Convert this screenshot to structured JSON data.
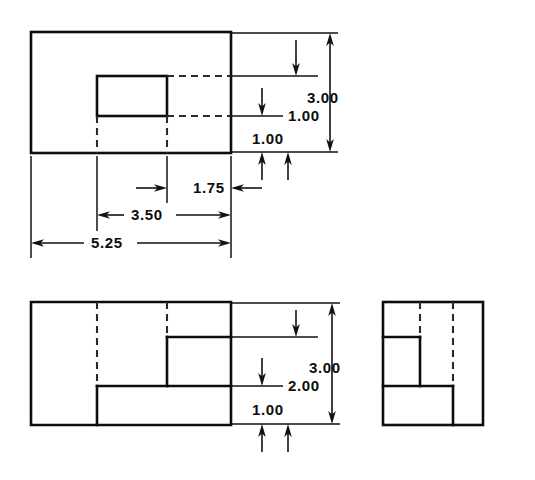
{
  "drawing": {
    "title": "Three-view orthographic engineering drawing of a stepped block with rectangular recess",
    "units": "inches",
    "line_color": "#0d0d0d",
    "background_color": "#ffffff",
    "views": [
      {
        "name": "top-view",
        "label": "Top View",
        "outline": {
          "x": 31,
          "y": 32,
          "width": 200,
          "height": 121
        },
        "features": [
          {
            "name": "recess-rectangle",
            "x": 97,
            "y": 76,
            "width": 70,
            "height": 40
          },
          {
            "name": "hidden-edge-horizontal-upper",
            "x1": 167,
            "y1": 76,
            "x2": 231,
            "y2": 76
          },
          {
            "name": "hidden-edge-horizontal-lower",
            "x1": 167,
            "y1": 116,
            "x2": 231,
            "y2": 116
          },
          {
            "name": "hidden-edge-vertical-left",
            "x1": 97,
            "y1": 116,
            "x2": 97,
            "y2": 153
          },
          {
            "name": "hidden-edge-vertical-right",
            "x1": 167,
            "y1": 116,
            "x2": 167,
            "y2": 153
          }
        ]
      },
      {
        "name": "front-view",
        "label": "Front View",
        "outline": {
          "x": 31,
          "y": 302,
          "width": 200,
          "height": 123
        },
        "features": [
          {
            "name": "step-edge-upper",
            "x1": 167,
            "y1": 337,
            "x2": 231,
            "y2": 337
          },
          {
            "name": "step-riser-upper",
            "x1": 167,
            "y1": 337,
            "x2": 167,
            "y2": 386
          },
          {
            "name": "step-edge-lower",
            "x1": 97,
            "y1": 386,
            "x2": 231,
            "y2": 386
          },
          {
            "name": "step-riser-lower",
            "x1": 97,
            "y1": 386,
            "x2": 97,
            "y2": 425
          },
          {
            "name": "hidden-line-left",
            "x1": 97,
            "y1": 302,
            "x2": 97,
            "y2": 386
          },
          {
            "name": "hidden-line-right",
            "x1": 167,
            "y1": 302,
            "x2": 167,
            "y2": 337
          }
        ]
      },
      {
        "name": "side-view",
        "label": "Side View",
        "outline": {
          "x": 383,
          "y": 302,
          "width": 100,
          "height": 123
        },
        "features": [
          {
            "name": "step-edge-upper",
            "x1": 383,
            "y1": 337,
            "x2": 420,
            "y2": 337
          },
          {
            "name": "step-riser-upper",
            "x1": 420,
            "y1": 337,
            "x2": 420,
            "y2": 386
          },
          {
            "name": "step-edge-lower",
            "x1": 383,
            "y1": 386,
            "x2": 453,
            "y2": 386
          },
          {
            "name": "step-riser-lower",
            "x1": 453,
            "y1": 386,
            "x2": 453,
            "y2": 425
          },
          {
            "name": "hidden-line-left",
            "x1": 420,
            "y1": 302,
            "x2": 420,
            "y2": 337
          },
          {
            "name": "hidden-line-right",
            "x1": 453,
            "y1": 302,
            "x2": 453,
            "y2": 386
          }
        ]
      }
    ],
    "dimensions": [
      {
        "name": "dim-top-overall-height",
        "value": "3.00",
        "orientation": "vertical",
        "view": "top-view",
        "text_x": 307,
        "text_y": 103
      },
      {
        "name": "dim-top-recess-depth",
        "value": "1.00",
        "orientation": "vertical",
        "view": "top-view",
        "text_x": 288,
        "text_y": 117
      },
      {
        "name": "dim-top-lower-offset",
        "value": "1.00",
        "orientation": "vertical",
        "view": "top-view",
        "text_x": 252,
        "text_y": 140
      },
      {
        "name": "dim-top-recess-width",
        "value": "1.75",
        "orientation": "horizontal",
        "view": "top-view",
        "text_x": 193,
        "text_y": 193
      },
      {
        "name": "dim-top-mid-width",
        "value": "3.50",
        "orientation": "horizontal",
        "view": "top-view",
        "text_x": 131,
        "text_y": 220
      },
      {
        "name": "dim-top-overall-width",
        "value": "5.25",
        "orientation": "horizontal",
        "view": "top-view",
        "text_x": 91,
        "text_y": 248
      },
      {
        "name": "dim-front-overall-height",
        "value": "3.00",
        "orientation": "vertical",
        "view": "front-view",
        "text_x": 309,
        "text_y": 373
      },
      {
        "name": "dim-front-step-height",
        "value": "2.00",
        "orientation": "vertical",
        "view": "front-view",
        "text_x": 288,
        "text_y": 387
      },
      {
        "name": "dim-front-base-height",
        "value": "1.00",
        "orientation": "vertical",
        "view": "front-view",
        "text_x": 252,
        "text_y": 411
      }
    ]
  }
}
